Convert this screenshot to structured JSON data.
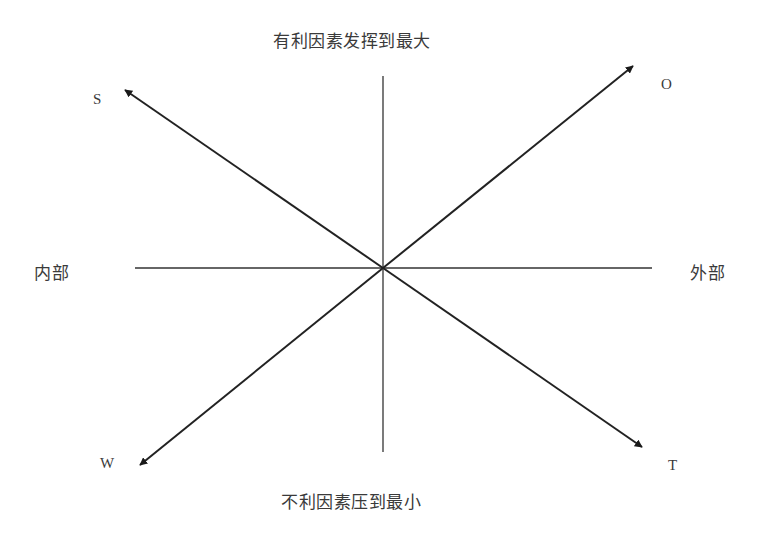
{
  "diagram": {
    "type": "SWOT direction diagram",
    "top_label": "有利因素发挥到最大",
    "bottom_label": "不利因素压到最小",
    "left_label": "内部",
    "right_label": "外部",
    "quadrant_labels": {
      "top_left": "S",
      "top_right": "O",
      "bottom_left": "W",
      "bottom_right": "T"
    },
    "axes": {
      "horizontal": {
        "from": [
          135,
          268
        ],
        "to": [
          652,
          268
        ]
      },
      "vertical": {
        "from": [
          383,
          76
        ],
        "to": [
          383,
          452
        ]
      }
    },
    "arrows": [
      {
        "name": "S",
        "from": [
          383,
          268
        ],
        "to": [
          125,
          90
        ]
      },
      {
        "name": "O",
        "from": [
          383,
          268
        ],
        "to": [
          633,
          66
        ]
      },
      {
        "name": "W",
        "from": [
          383,
          268
        ],
        "to": [
          140,
          465
        ]
      },
      {
        "name": "T",
        "from": [
          383,
          268
        ],
        "to": [
          642,
          447
        ]
      }
    ],
    "line_color": "#222222"
  }
}
